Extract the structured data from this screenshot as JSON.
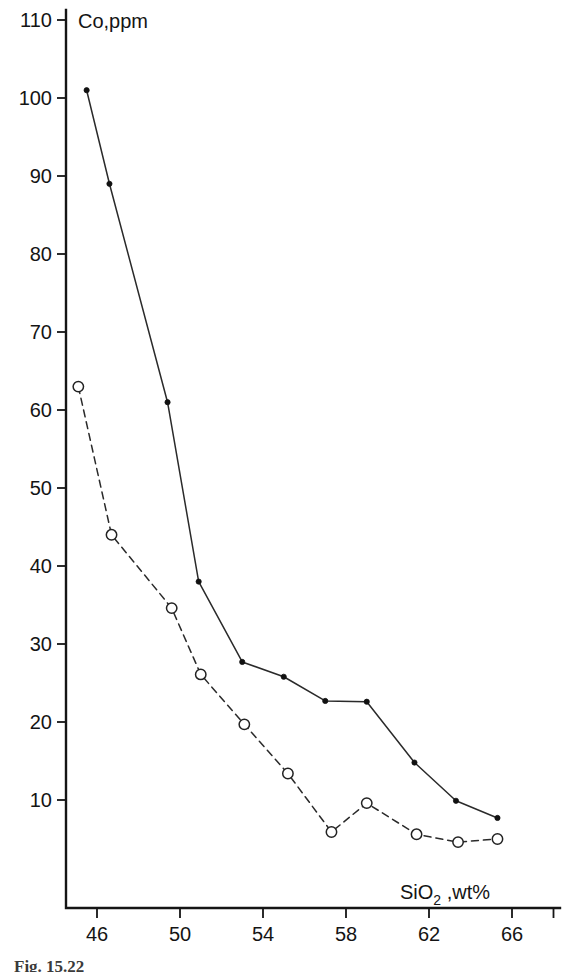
{
  "chart_data": {
    "type": "line",
    "title": "",
    "xlabel": "SiO2 ,wt%",
    "xlabel_base": "SiO",
    "xlabel_sub": "2",
    "xlabel_tail": " ,wt%",
    "ylabel": "Co,ppm",
    "xlim": [
      44.0,
      68.0
    ],
    "ylim": [
      0.2,
      110.0
    ],
    "xticks": [
      46,
      50,
      54,
      58,
      62,
      66
    ],
    "xtick_labels": [
      "46",
      "50",
      "54",
      "58",
      "62",
      "66"
    ],
    "yticks": [
      10,
      20,
      30,
      40,
      50,
      60,
      70,
      80,
      90,
      100,
      110
    ],
    "ytick_labels": [
      "10",
      "20",
      "30",
      "40",
      "50",
      "60",
      "70",
      "80",
      "90",
      "100",
      "110"
    ],
    "extra_xticks": [
      68
    ],
    "grid": false,
    "legend": "none",
    "series": [
      {
        "name": "filled-circles",
        "marker": "filled-circle",
        "linestyle": "solid",
        "color": "#111111",
        "x": [
          45.5,
          46.6,
          49.4,
          50.9,
          53.0,
          55.0,
          57.0,
          59.0,
          61.3,
          63.3,
          65.3
        ],
        "values": [
          101.0,
          89.0,
          61.0,
          38.0,
          27.7,
          25.8,
          22.7,
          22.6,
          14.8,
          9.9,
          7.7
        ]
      },
      {
        "name": "open-circles",
        "marker": "open-circle",
        "linestyle": "dashed",
        "color": "#222222",
        "x": [
          45.1,
          46.7,
          49.6,
          51.0,
          53.1,
          55.2,
          57.3,
          59.0,
          61.4,
          63.4,
          65.3
        ],
        "values": [
          63.0,
          44.0,
          34.6,
          26.1,
          19.7,
          13.4,
          5.9,
          9.6,
          5.6,
          4.6,
          5.0
        ]
      }
    ]
  },
  "caption": {
    "text": "Fig. 15.22"
  }
}
